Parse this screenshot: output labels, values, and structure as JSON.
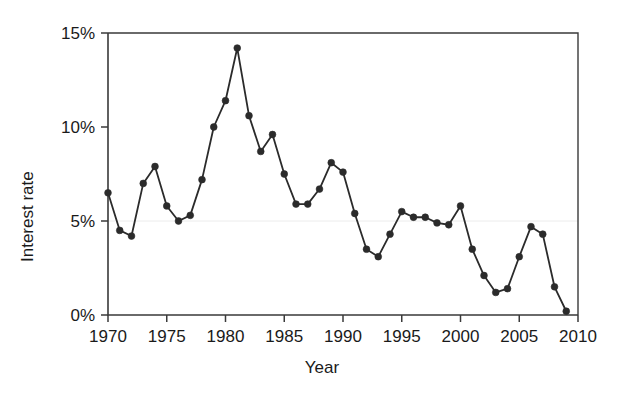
{
  "chart_data": {
    "type": "line",
    "title": "",
    "subtitle": "",
    "xlabel": "Year",
    "ylabel": "Interest rate",
    "xlim": [
      1970,
      2010
    ],
    "ylim": [
      0,
      15
    ],
    "xticks": [
      1970,
      1975,
      1980,
      1985,
      1990,
      1995,
      2000,
      2005,
      2010
    ],
    "xtick_labels": [
      "1970",
      "1975",
      "1980",
      "1985",
      "1990",
      "1995",
      "2000",
      "2005",
      "2010"
    ],
    "yticks": [
      0,
      5,
      10,
      15
    ],
    "ytick_labels": [
      "0%",
      "5%",
      "10%",
      "15%"
    ],
    "grid": "horizontal-faint-at-5",
    "legend": "none",
    "marker": "filled-circle",
    "line_color": "#2b2b2b",
    "marker_color": "#2b2b2b",
    "grid_color": "#ececec",
    "axis_color": "#3a3a3a",
    "background": "#ffffff",
    "x": [
      1970,
      1971,
      1972,
      1973,
      1974,
      1975,
      1976,
      1977,
      1978,
      1979,
      1980,
      1981,
      1982,
      1983,
      1984,
      1985,
      1986,
      1987,
      1988,
      1989,
      1990,
      1991,
      1992,
      1993,
      1994,
      1995,
      1996,
      1997,
      1998,
      1999,
      2000,
      2001,
      2002,
      2003,
      2004,
      2005,
      2006,
      2007,
      2008,
      2009
    ],
    "values": [
      6.5,
      4.5,
      4.2,
      7.0,
      7.9,
      5.8,
      5.0,
      5.3,
      7.2,
      10.0,
      11.4,
      14.2,
      10.6,
      8.7,
      9.6,
      7.5,
      5.9,
      5.9,
      6.7,
      8.1,
      7.6,
      5.4,
      3.5,
      3.1,
      4.3,
      5.5,
      5.2,
      5.2,
      4.9,
      4.8,
      5.8,
      3.5,
      2.1,
      1.2,
      1.4,
      3.1,
      4.7,
      4.3,
      1.5,
      0.2
    ],
    "series": [
      {
        "name": "Interest rate",
        "values": [
          6.5,
          4.5,
          4.2,
          7.0,
          7.9,
          5.8,
          5.0,
          5.3,
          7.2,
          10.0,
          11.4,
          14.2,
          10.6,
          8.7,
          9.6,
          7.5,
          5.9,
          5.9,
          6.7,
          8.1,
          7.6,
          5.4,
          3.5,
          3.1,
          4.3,
          5.5,
          5.2,
          5.2,
          4.9,
          4.8,
          5.8,
          3.5,
          2.1,
          1.2,
          1.4,
          3.1,
          4.7,
          4.3,
          1.5,
          0.2
        ]
      }
    ],
    "annotations": [],
    "notes": {
      "peak_year": "1981",
      "peak_value": "14.2%",
      "min_year": "2009",
      "min_value": "0.2%"
    }
  }
}
